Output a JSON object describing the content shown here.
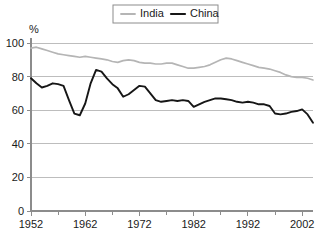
{
  "chart_data": {
    "type": "line",
    "title": "",
    "xlabel": "",
    "ylabel": "%",
    "unit_label": "%",
    "xlim": [
      1952,
      2004
    ],
    "ylim": [
      0,
      100
    ],
    "grid": true,
    "legend_position": "top-center",
    "y_ticks": [
      0,
      20,
      40,
      60,
      80,
      100
    ],
    "y_tick_labels": [
      "0",
      "20",
      "40",
      "60",
      "80",
      "100"
    ],
    "x_ticks_major": [
      1952,
      1962,
      1972,
      1982,
      1992,
      2002
    ],
    "x_tick_labels": [
      "1952",
      "1962",
      "1972",
      "1982",
      "1992",
      "2002"
    ],
    "x_ticks_minor": [
      1957,
      1967,
      1977,
      1987,
      1997
    ],
    "x": [
      1952,
      1953,
      1954,
      1955,
      1956,
      1957,
      1958,
      1959,
      1960,
      1961,
      1962,
      1963,
      1964,
      1965,
      1966,
      1967,
      1968,
      1969,
      1970,
      1971,
      1972,
      1973,
      1974,
      1975,
      1976,
      1977,
      1978,
      1979,
      1980,
      1981,
      1982,
      1983,
      1984,
      1985,
      1986,
      1987,
      1988,
      1989,
      1990,
      1991,
      1992,
      1993,
      1994,
      1995,
      1996,
      1997,
      1998,
      1999,
      2000,
      2001,
      2002,
      2003,
      2004
    ],
    "series": [
      {
        "name": "India",
        "color": "#b5b5b5",
        "values": [
          97,
          97.5,
          96.5,
          95.5,
          94.5,
          93.5,
          93,
          92.5,
          92,
          91.5,
          92,
          91.5,
          91,
          90.5,
          90,
          89,
          88.5,
          89.5,
          90,
          89.5,
          88.5,
          88,
          88,
          87.5,
          87.5,
          88,
          88,
          87,
          86,
          85,
          85,
          85.5,
          86,
          87,
          88.5,
          90,
          91,
          90.5,
          89.5,
          88.5,
          87.5,
          86.5,
          85.5,
          85,
          84.5,
          83.5,
          82.5,
          81,
          80,
          79.5,
          79.5,
          79,
          78
        ]
      },
      {
        "name": "China",
        "color": "#161616",
        "values": [
          79,
          76,
          73.5,
          74.5,
          76,
          75.5,
          74.5,
          66,
          58,
          57,
          64,
          76,
          84,
          83,
          79,
          75.5,
          73,
          68,
          69.5,
          72,
          74.5,
          74,
          70,
          66,
          65,
          65.5,
          66,
          65.5,
          66,
          65.5,
          62,
          63.5,
          65,
          66,
          67,
          67,
          66.5,
          66,
          65,
          64.5,
          65,
          64.5,
          63.5,
          63.5,
          62.5,
          58,
          57.5,
          58,
          59,
          59.5,
          60.5,
          57.5,
          52.5
        ]
      }
    ]
  },
  "legend": {
    "items": [
      {
        "label": "India",
        "color": "#b5b5b5"
      },
      {
        "label": "China",
        "color": "#161616"
      }
    ]
  }
}
